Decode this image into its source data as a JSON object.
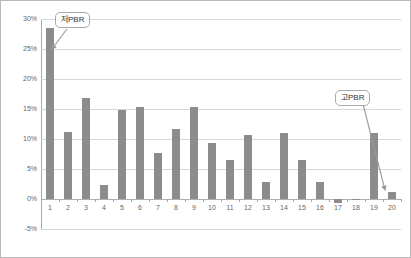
{
  "chart_data": {
    "type": "bar",
    "title": "",
    "subtitle": "",
    "xlabel": "",
    "ylabel": "",
    "categories": [
      "1",
      "2",
      "3",
      "4",
      "5",
      "6",
      "7",
      "8",
      "9",
      "10",
      "11",
      "12",
      "13",
      "14",
      "15",
      "16",
      "17",
      "18",
      "19",
      "20"
    ],
    "values": [
      28.5,
      11.2,
      16.8,
      2.3,
      14.8,
      15.4,
      7.6,
      11.7,
      15.3,
      9.3,
      6.5,
      10.6,
      2.8,
      11.0,
      6.5,
      2.8,
      -0.6,
      0.0,
      11.0,
      1.1
    ],
    "ylim": [
      -5,
      30
    ],
    "ytick_labels": [
      "30%",
      "25%",
      "20%",
      "15%",
      "10%",
      "5%",
      "0%",
      "-5%"
    ],
    "ytick_values": [
      30,
      25,
      20,
      15,
      10,
      5,
      0,
      -5
    ],
    "grid": true,
    "legend": "none",
    "bar_color": "#8c8c8c",
    "gridline_color": "#d7d7d7",
    "axis_color": "#a8a8a8",
    "tick_label_color": "#666666",
    "annotations": [
      {
        "id": "low",
        "label": "저PBR",
        "points_to_category": "1"
      },
      {
        "id": "high",
        "label": "고PBR",
        "points_to_category": "20"
      }
    ]
  }
}
